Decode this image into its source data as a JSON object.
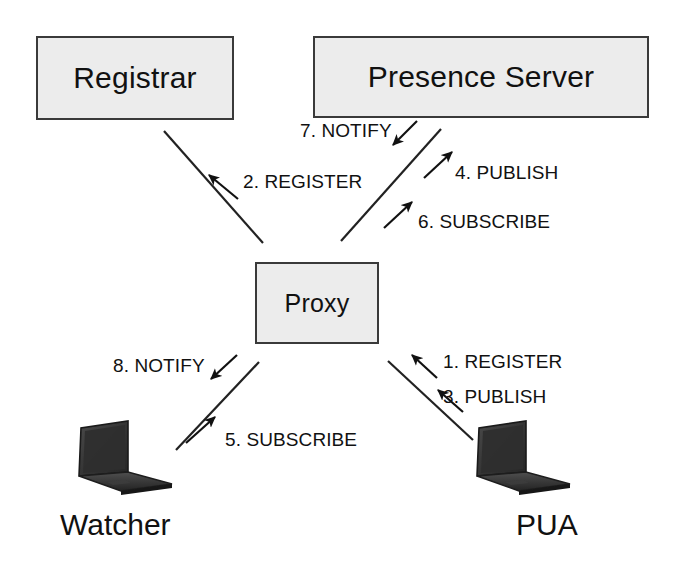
{
  "diagram": {
    "background_color": "#ffffff",
    "box_fill_color": "#ececec",
    "box_border_color": "#3a3a3a",
    "text_color": "#111111"
  },
  "nodes": {
    "registrar": {
      "label": "Registrar"
    },
    "presence_server": {
      "label": "Presence Server"
    },
    "proxy": {
      "label": "Proxy"
    },
    "watcher": {
      "label": "Watcher",
      "icon": "laptop-icon"
    },
    "pua": {
      "label": "PUA",
      "icon": "laptop-icon"
    }
  },
  "messages": [
    {
      "step": 1,
      "label": "1. REGISTER",
      "from": "pua",
      "to": "proxy",
      "direction": "up-left"
    },
    {
      "step": 2,
      "label": "2. REGISTER",
      "from": "proxy",
      "to": "registrar",
      "direction": "up-left"
    },
    {
      "step": 3,
      "label": "3. PUBLISH",
      "from": "pua",
      "to": "proxy",
      "direction": "up-left"
    },
    {
      "step": 4,
      "label": "4. PUBLISH",
      "from": "proxy",
      "to": "presence_server",
      "direction": "up-right"
    },
    {
      "step": 5,
      "label": "5. SUBSCRIBE",
      "from": "watcher",
      "to": "proxy",
      "direction": "up-right"
    },
    {
      "step": 6,
      "label": "6. SUBSCRIBE",
      "from": "proxy",
      "to": "presence_server",
      "direction": "up-right"
    },
    {
      "step": 7,
      "label": "7. NOTIFY",
      "from": "presence_server",
      "to": "proxy",
      "direction": "down-left"
    },
    {
      "step": 8,
      "label": "8. NOTIFY",
      "from": "proxy",
      "to": "watcher",
      "direction": "down-left"
    }
  ]
}
